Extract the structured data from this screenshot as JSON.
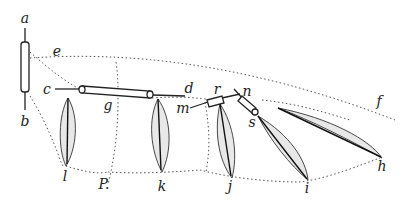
{
  "figure": {
    "ink_color": "#222222",
    "background": "#ffffff",
    "labels": [
      {
        "id": "a",
        "text": "a",
        "x": 25,
        "y": 18
      },
      {
        "id": "b",
        "text": "b",
        "x": 25,
        "y": 121
      },
      {
        "id": "e",
        "text": "e",
        "x": 57,
        "y": 51
      },
      {
        "id": "c",
        "text": "c",
        "x": 47,
        "y": 89
      },
      {
        "id": "g",
        "text": "g",
        "x": 108,
        "y": 105
      },
      {
        "id": "d",
        "text": "d",
        "x": 189,
        "y": 88
      },
      {
        "id": "m",
        "text": "m",
        "x": 183,
        "y": 108
      },
      {
        "id": "r",
        "text": "r",
        "x": 217,
        "y": 89
      },
      {
        "id": "n",
        "text": "n",
        "x": 247,
        "y": 91
      },
      {
        "id": "s",
        "text": "s",
        "x": 252,
        "y": 122
      },
      {
        "id": "f",
        "text": "f",
        "x": 379,
        "y": 101
      },
      {
        "id": "l",
        "text": "l",
        "x": 65,
        "y": 176
      },
      {
        "id": "P",
        "text": "P.",
        "x": 104,
        "y": 184
      },
      {
        "id": "k",
        "text": "k",
        "x": 162,
        "y": 186
      },
      {
        "id": "j",
        "text": "j",
        "x": 230,
        "y": 186
      },
      {
        "id": "i",
        "text": "i",
        "x": 307,
        "y": 188
      },
      {
        "id": "h",
        "text": "h",
        "x": 382,
        "y": 166
      }
    ]
  }
}
